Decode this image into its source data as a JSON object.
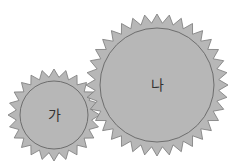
{
  "diagram": {
    "type": "gears",
    "colors": {
      "fill": "#b7b7b7",
      "stroke": "#7a7a7a",
      "text": "#333333",
      "background": "#ffffff"
    },
    "gears": [
      {
        "id": "small",
        "label": "가",
        "cx": 54,
        "cy": 115,
        "outer_r": 46,
        "root_r": 38,
        "inner_r": 34,
        "teeth": 24
      },
      {
        "id": "large",
        "label": "나",
        "cx": 157,
        "cy": 85,
        "outer_r": 71,
        "root_r": 62,
        "inner_r": 57,
        "teeth": 36
      }
    ]
  }
}
